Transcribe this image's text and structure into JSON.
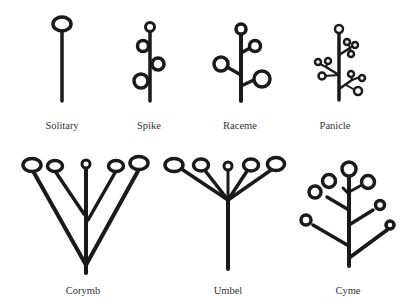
{
  "diagram": {
    "type": "inflorescence types",
    "colors": {
      "ink": "#1a1a1a",
      "label": "#333333",
      "background": "#ffffff"
    },
    "items": [
      {
        "label": "Solitary"
      },
      {
        "label": "Spike"
      },
      {
        "label": "Raceme"
      },
      {
        "label": "Panicle"
      },
      {
        "label": "Corymb"
      },
      {
        "label": "Umbel"
      },
      {
        "label": "Cyme"
      }
    ]
  }
}
